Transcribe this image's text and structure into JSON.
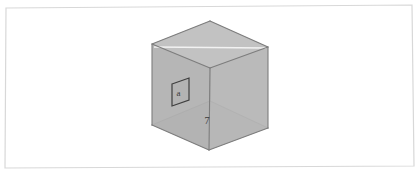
{
  "figure": {
    "background_color": "#ffffff",
    "frame": {
      "name": "page-border-frame",
      "stroke_color": "#d8d8d8",
      "stroke_width": 1.2,
      "points": "6,8 412,5 414,166 5,168"
    },
    "cube": {
      "name": "isometric-cube",
      "description": "Translucent gray cube drawn in isometric projection, all twelve edges visible",
      "edge_color": "#7d7d7d",
      "hidden_edge_color": "#8e8e8e",
      "edge_width": 1.1,
      "face_colors": {
        "top": "#c2c2c2",
        "left": "#b5b5b5",
        "right": "#b9b9b9",
        "bottom": "#adadad",
        "back": "#bdbdbd"
      },
      "highlight_line_color": "#f2f2f2",
      "vertices": {
        "top_back": "210,21",
        "top_left": "152,44",
        "top_front": "210,68",
        "top_right": "268,47",
        "bottom_back": "210,101",
        "bottom_left": "152,125",
        "bottom_front": "209,150",
        "bottom_right": "268,128"
      }
    },
    "inset_square": {
      "name": "square-a-inset",
      "label": "a",
      "description": "Small square drawn on the interior left face of the cube",
      "stroke_color": "#3f3f3f",
      "stroke_width": 1.2,
      "fill_color": "#b3b3b3",
      "points": "172,84 189,78 189,100 172,106",
      "label_position": {
        "x": 178.5,
        "y": 96
      },
      "label_font_size": 9
    },
    "edge_label": {
      "name": "edge-length-label",
      "text": "7",
      "position": {
        "x": 207,
        "y": 124
      },
      "font_size": 10,
      "color": "#3a3a3a"
    }
  }
}
